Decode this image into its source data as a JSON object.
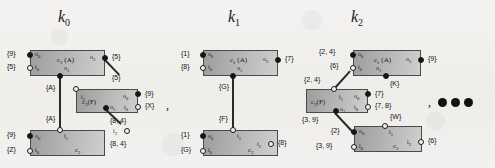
{
  "figure": {
    "background_hex": "#f1f0ee",
    "box_fill_hex": "#b4b4b4",
    "ink_hex": "#141414",
    "ellipsis_label": "ellipsis-three-dots"
  },
  "separators": {
    "comma": ","
  },
  "panels": [
    {
      "id": "k0",
      "title": "k",
      "title_sub": "0",
      "boxes": [
        {
          "name": "c",
          "name_sub": "1",
          "name_suffix": "(A)"
        },
        {
          "name": "c",
          "name_sub": "3",
          "name_suffix": "(F)"
        },
        {
          "name": "c",
          "name_sub": "2",
          "name_suffix": ""
        }
      ],
      "ports": [
        {
          "id": "o",
          "sub": "0",
          "kind": "filled",
          "set": "{9}"
        },
        {
          "id": "i",
          "sub": "0",
          "kind": "open",
          "set": "{5}"
        },
        {
          "id": "o",
          "sub": "2",
          "kind": "filled",
          "set": "{5}"
        },
        {
          "id": "o",
          "sub": "1",
          "kind": "filled",
          "set": ""
        },
        {
          "id": "i",
          "sub": "1",
          "kind": "open",
          "set": "{5}"
        },
        {
          "id": "o",
          "sub": "0",
          "kind": "filled",
          "set": "{9}"
        },
        {
          "id": "i",
          "sub": "0",
          "kind": "open",
          "set": "{X}"
        },
        {
          "id": "o",
          "sub": "1",
          "kind": "filled",
          "set": "{8, 4}"
        },
        {
          "id": "i",
          "sub": "2",
          "kind": "open",
          "set": "{8, 4}"
        },
        {
          "id": "i",
          "sub": "1",
          "kind": "open",
          "set": ""
        },
        {
          "id": "o",
          "sub": "0",
          "kind": "filled",
          "set": "{9}"
        },
        {
          "id": "i",
          "sub": "0",
          "kind": "open",
          "set": "{Z}"
        }
      ],
      "edge_labels": [
        "{A}",
        "{A}"
      ]
    },
    {
      "id": "k1",
      "title": "k",
      "title_sub": "1",
      "boxes": [
        {
          "name": "c",
          "name_sub": "1",
          "name_suffix": "(A)"
        },
        {
          "name": "c",
          "name_sub": "2",
          "name_suffix": ""
        }
      ],
      "ports": [
        {
          "id": "o",
          "sub": "0",
          "kind": "filled",
          "set": "{1}"
        },
        {
          "id": "i",
          "sub": "0",
          "kind": "open",
          "set": "{8}"
        },
        {
          "id": "o",
          "sub": "2",
          "kind": "filled",
          "set": "{7}"
        },
        {
          "id": "o",
          "sub": "1",
          "kind": "filled",
          "set": ""
        },
        {
          "id": "i",
          "sub": "1",
          "kind": "open",
          "set": ""
        },
        {
          "id": "o",
          "sub": "0",
          "kind": "filled",
          "set": "{1}"
        },
        {
          "id": "i",
          "sub": "0",
          "kind": "open",
          "set": "{G}"
        },
        {
          "id": "i",
          "sub": "2",
          "kind": "open",
          "set": "{8}"
        }
      ],
      "edge_labels": [
        "{G}",
        "{F}"
      ]
    },
    {
      "id": "k2",
      "title": "k",
      "title_sub": "2",
      "boxes": [
        {
          "name": "c",
          "name_sub": "1",
          "name_suffix": "(A)"
        },
        {
          "name": "c",
          "name_sub": "3",
          "name_suffix": "(F)"
        },
        {
          "name": "c",
          "name_sub": "2",
          "name_suffix": ""
        }
      ],
      "ports": [
        {
          "id": "o",
          "sub": "0",
          "kind": "filled",
          "set": "{2, 4}"
        },
        {
          "id": "i",
          "sub": "0",
          "kind": "open",
          "set": "{6}"
        },
        {
          "id": "o",
          "sub": "2",
          "kind": "filled",
          "set": "{9}"
        },
        {
          "id": "o",
          "sub": "1",
          "kind": "filled",
          "set": "{K}"
        },
        {
          "id": "i",
          "sub": "1",
          "kind": "open",
          "set": "{2, 4}"
        },
        {
          "id": "o",
          "sub": "0",
          "kind": "filled",
          "set": "{7}"
        },
        {
          "id": "i",
          "sub": "0",
          "kind": "open",
          "set": "{7, 8}"
        },
        {
          "id": "o",
          "sub": "1",
          "kind": "filled",
          "set": "{3, 9}"
        },
        {
          "id": "o",
          "sub": "0",
          "kind": "filled",
          "set": "{2}"
        },
        {
          "id": "i",
          "sub": "0",
          "kind": "open",
          "set": "{3, 9}"
        },
        {
          "id": "i",
          "sub": "1",
          "kind": "open",
          "set": "{W}"
        },
        {
          "id": "i",
          "sub": "2",
          "kind": "open",
          "set": "{6}"
        }
      ],
      "edge_labels": []
    }
  ]
}
